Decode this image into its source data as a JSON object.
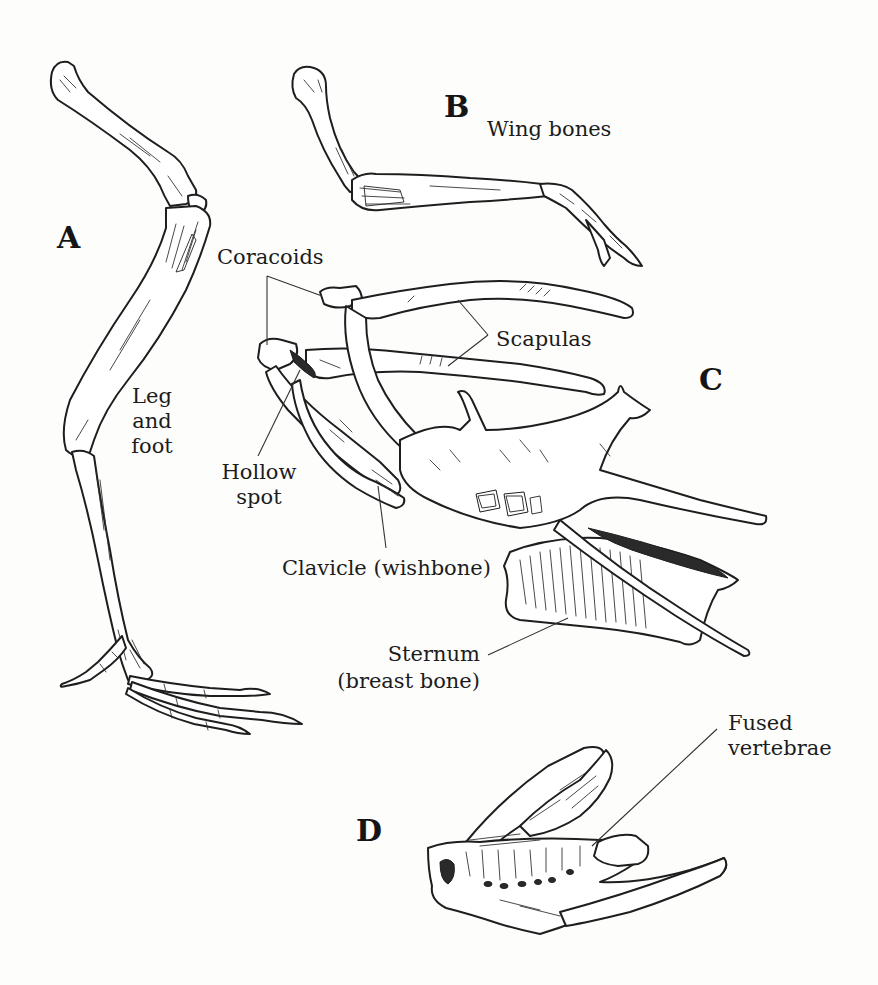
{
  "figure": {
    "panels": [
      {
        "id": "A",
        "letter": "A",
        "subject": "Leg and foot"
      },
      {
        "id": "B",
        "letter": "B",
        "subject": "Wing bones"
      },
      {
        "id": "C",
        "letter": "C",
        "subject": "Shoulder girdle and sternum"
      },
      {
        "id": "D",
        "letter": "D",
        "subject": "Fused vertebrae"
      }
    ],
    "labels": {
      "leg_and_foot": "Leg\nand\nfoot",
      "wing_bones": "Wing bones",
      "coracoids": "Coracoids",
      "scapulas": "Scapulas",
      "hollow_spot": "Hollow\nspot",
      "clavicle": "Clavicle (wishbone)",
      "sternum": "Sternum\n(breast bone)",
      "fused_vertebrae": "Fused\nvertebrae"
    },
    "colors": {
      "ink": "#1e1e1e",
      "paper": "#fdfdfc"
    }
  }
}
